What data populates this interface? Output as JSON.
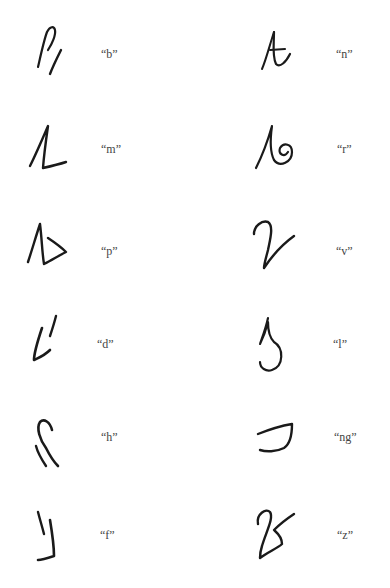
{
  "entries": [
    {
      "id": "b",
      "label": "“b”"
    },
    {
      "id": "n",
      "label": "“n”"
    },
    {
      "id": "m",
      "label": "“m”"
    },
    {
      "id": "r",
      "label": "“r”"
    },
    {
      "id": "p",
      "label": "“p”"
    },
    {
      "id": "v",
      "label": "“v”"
    },
    {
      "id": "d",
      "label": "“d”"
    },
    {
      "id": "l",
      "label": "“l”"
    },
    {
      "id": "h",
      "label": "“h”"
    },
    {
      "id": "ng",
      "label": "“ng”"
    },
    {
      "id": "f",
      "label": "“f”"
    },
    {
      "id": "z",
      "label": "“z”"
    }
  ]
}
